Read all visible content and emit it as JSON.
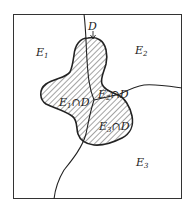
{
  "diagram": {
    "regions": [
      {
        "name": "E1",
        "base": "E",
        "sub": "1"
      },
      {
        "name": "E2",
        "base": "E",
        "sub": "2"
      },
      {
        "name": "E3",
        "base": "E",
        "sub": "3"
      }
    ],
    "set_label": "D",
    "intersections": [
      {
        "base": "E",
        "sub": "1",
        "op": "∩",
        "set": "D"
      },
      {
        "base": "E",
        "sub": "2",
        "op": "∩",
        "set": "D"
      },
      {
        "base": "E",
        "sub": "3",
        "op": "∩",
        "set": "D"
      }
    ],
    "colors": {
      "line": "#222222",
      "hatch": "#333333",
      "background": "#ffffff"
    }
  }
}
